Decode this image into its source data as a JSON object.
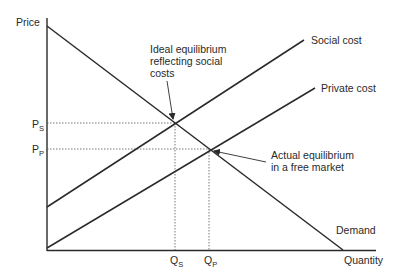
{
  "diagram": {
    "type": "supply-demand externality diagram",
    "axes": {
      "y_label": "Price",
      "x_label": "Quantity"
    },
    "curves": [
      {
        "name": "Demand",
        "label": "Demand"
      },
      {
        "name": "Social cost",
        "label": "Social cost"
      },
      {
        "name": "Private cost",
        "label": "Private cost"
      }
    ],
    "price_ticks": [
      {
        "main": "P",
        "sub": "S"
      },
      {
        "main": "P",
        "sub": "P"
      }
    ],
    "quantity_ticks": [
      {
        "main": "Q",
        "sub": "S"
      },
      {
        "main": "Q",
        "sub": "P"
      }
    ],
    "annotations": {
      "ideal": [
        "Ideal equilibrium",
        "reflecting social",
        "costs"
      ],
      "actual": [
        "Actual equilibrium",
        "in a free market"
      ]
    },
    "colors": {
      "line": "#2a2a2a",
      "guide": "#555555",
      "background": "#ffffff"
    }
  }
}
